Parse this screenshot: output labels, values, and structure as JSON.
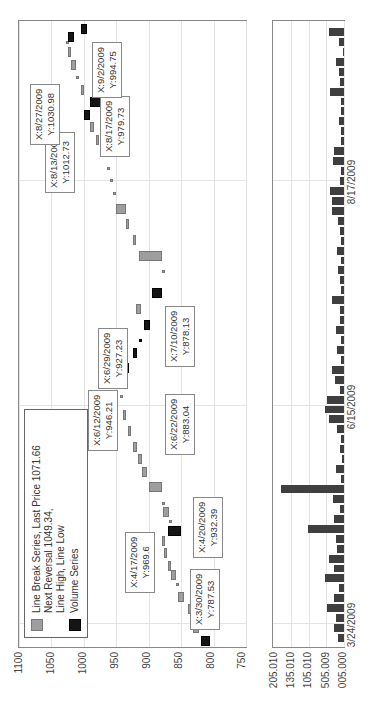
{
  "chart_data": [
    {
      "type": "bar",
      "subtype": "line-break (three-line break) price chart",
      "title": "",
      "xlabel": "",
      "ylabel": "",
      "ylim": [
        750,
        1100
      ],
      "yticks": [
        "1100",
        "1050",
        "1000",
        "950",
        "900",
        "850",
        "800",
        "750"
      ],
      "grid": true,
      "legend": {
        "position": "upper-left",
        "entries": [
          {
            "label": "Line Break Series, Last Price 1071.66 Next Reversal 1049.34, Line High, Line Low",
            "lines": [
              "Line Break Series, Last Price 1071.66",
              "Next Reversal 1049.34,",
              "Line High, Line Low"
            ],
            "color": "#9e9e9e"
          },
          {
            "label": "Volume Series",
            "lines": [
              "Volume Series"
            ],
            "color": "#151515"
          }
        ]
      },
      "annotations": [
        {
          "x": "3/30/2009",
          "y": "787.53",
          "lines": [
            "X:3/30/2009",
            "Y:787.53"
          ]
        },
        {
          "x": "4/17/2009",
          "y": "969.6",
          "lines": [
            "X:4/17/2009",
            "Y:969.6"
          ]
        },
        {
          "x": "4/20/2009",
          "y": "932.39",
          "lines": [
            "X:4/20/2009",
            "Y:932.39"
          ]
        },
        {
          "x": "6/12/2009",
          "y": "946.21",
          "lines": [
            "X:6/12/2009",
            "Y:946.21"
          ]
        },
        {
          "x": "6/22/2009",
          "y": "883.04",
          "lines": [
            "X:6/22/2009",
            "Y:883.04"
          ]
        },
        {
          "x": "6/29/2009",
          "y": "927.23",
          "lines": [
            "X:6/29/2009",
            "Y:927.23"
          ]
        },
        {
          "x": "7/10/2009",
          "y": "878.13",
          "lines": [
            "X:7/10/2009",
            "Y:878.13"
          ]
        },
        {
          "x": "8/13/2009",
          "y": "1012.73",
          "lines": [
            "X:8/13/2009",
            "Y:1012.73"
          ]
        },
        {
          "x": "8/17/2009",
          "y": "979.73",
          "lines": [
            "X:8/17/2009",
            "Y:979.73"
          ]
        },
        {
          "x": "8/27/2009",
          "y": "1030.98",
          "lines": [
            "X:8/27/2009",
            "Y:1030.98"
          ]
        },
        {
          "x": "9/2/2009",
          "y": "994.75",
          "lines": [
            "X:9/2/2009",
            "Y:994.75"
          ]
        }
      ],
      "series": [
        {
          "name": "Line Break Series",
          "note": "price bricks; up=gray, down=black; [pos(0-1 along time), open, close]",
          "bricks": [
            [
              0.01,
              820,
              805,
              "down"
            ],
            [
              0.03,
              822,
              832,
              "up"
            ],
            [
              0.045,
              810,
              790,
              "down"
            ],
            [
              0.06,
              830,
              840,
              "up"
            ],
            [
              0.08,
              845,
              855,
              "up"
            ],
            [
              0.1,
              855,
              858,
              "up"
            ],
            [
              0.115,
              858,
              866,
              "up"
            ],
            [
              0.13,
              866,
              870,
              "up"
            ],
            [
              0.15,
              872,
              877,
              "up"
            ],
            [
              0.17,
              880,
              875,
              "up"
            ],
            [
              0.185,
              870,
              850,
              "down"
            ],
            [
              0.2,
              865,
              868,
              "up"
            ],
            [
              0.215,
              868,
              878,
              "up"
            ],
            [
              0.23,
              878,
              880,
              "up"
            ],
            [
              0.255,
              880,
              900,
              "up"
            ],
            [
              0.28,
              903,
              910,
              "up"
            ],
            [
              0.3,
              910,
              917,
              "up"
            ],
            [
              0.32,
              918,
              925,
              "up"
            ],
            [
              0.345,
              928,
              932,
              "up"
            ],
            [
              0.37,
              935,
              940,
              "up"
            ],
            [
              0.4,
              942,
              945,
              "up"
            ],
            [
              0.42,
              946,
              946,
              "up"
            ],
            [
              0.445,
              940,
              930,
              "down"
            ],
            [
              0.47,
              925,
              918,
              "down"
            ],
            [
              0.49,
              915,
              912,
              "down"
            ],
            [
              0.515,
              908,
              898,
              "down"
            ],
            [
              0.54,
              912,
              920,
              "up"
            ],
            [
              0.565,
              895,
              880,
              "down"
            ],
            [
              0.6,
              878,
              880,
              "up"
            ],
            [
              0.625,
              880,
              915,
              "up"
            ],
            [
              0.65,
              920,
              925,
              "up"
            ],
            [
              0.675,
              930,
              935,
              "up"
            ],
            [
              0.7,
              935,
              950,
              "up"
            ],
            [
              0.725,
              952,
              955,
              "up"
            ],
            [
              0.745,
              958,
              960,
              "up"
            ],
            [
              0.765,
              962,
              965,
              "up"
            ],
            [
              0.79,
              965,
              975,
              "up"
            ],
            [
              0.81,
              978,
              982,
              "up"
            ],
            [
              0.83,
              985,
              990,
              "up"
            ],
            [
              0.85,
              1000,
              990,
              "down"
            ],
            [
              0.87,
              990,
              970,
              "down"
            ],
            [
              0.89,
              1000,
              1005,
              "up"
            ],
            [
              0.91,
              1010,
              1012,
              "up"
            ],
            [
              0.93,
              1012,
              1020,
              "up"
            ],
            [
              0.95,
              1020,
              1025,
              "up"
            ],
            [
              0.965,
              1025,
              1028,
              "up"
            ],
            [
              0.975,
              1025,
              1015,
              "down"
            ],
            [
              0.988,
              1005,
              995,
              "down"
            ]
          ]
        }
      ]
    },
    {
      "type": "bar",
      "title": "Volume Series",
      "xlabel": "",
      "ylabel": "",
      "yticks": [
        "205.010",
        "135.010",
        "105.010",
        "505.009",
        "005.000"
      ],
      "xticks": [
        "3/24/2009",
        "6/15/2009",
        "8/17/2009"
      ],
      "grid": true,
      "categories_note": "one bar per trading day, 3/24/2009 to ~9/10/2009",
      "values_relative": [
        0.08,
        0.15,
        0.12,
        0.25,
        0.15,
        0.07,
        0.28,
        0.14,
        0.22,
        0.1,
        0.11,
        0.52,
        0.14,
        0.06,
        0.16,
        0.92,
        0.05,
        0.12,
        0.03,
        0.06,
        0.04,
        0.1,
        0.22,
        0.28,
        0.25,
        0.06,
        0.13,
        0.17,
        0.05,
        0.1,
        0.05,
        0.12,
        0.06,
        0.06,
        0.17,
        0.04,
        0.06,
        0.08,
        0.04,
        0.1,
        0.05,
        0.06,
        0.08,
        0.18,
        0.17,
        0.2,
        0.06,
        0.05,
        0.16,
        0.14,
        0.05,
        0.05,
        0.07,
        0.05,
        0.04,
        0.2,
        0.06,
        0.07,
        0.12,
        0.02,
        0.07,
        0.22
      ]
    }
  ],
  "axis": {
    "price_ticks": [
      "1100",
      "1050",
      "1000",
      "950",
      "900",
      "850",
      "800",
      "750"
    ],
    "volume_ticks": [
      "205.010",
      "135.010",
      "105.010",
      "505.009",
      "005.000"
    ],
    "date_ticks": [
      "3/24/2009",
      "6/15/2009",
      "8/17/2009"
    ]
  },
  "legend": {
    "series1_line1": "Line Break Series, Last Price 1071.66",
    "series1_line2": "Next Reversal 1049.34,",
    "series1_line3": "Line High, Line Low",
    "series2_line1": "Volume Series"
  },
  "notes": [
    {
      "l1": "X:3/30/2009",
      "l2": "Y:787.53"
    },
    {
      "l1": "X:4/17/2009",
      "l2": "Y:969.6"
    },
    {
      "l1": "X:4/20/2009",
      "l2": "Y:932.39"
    },
    {
      "l1": "X:6/12/2009",
      "l2": "Y:946.21"
    },
    {
      "l1": "X:6/22/2009",
      "l2": "Y:883.04"
    },
    {
      "l1": "X:6/29/2009",
      "l2": "Y:927.23"
    },
    {
      "l1": "X:7/10/2009",
      "l2": "Y:878.13"
    },
    {
      "l1": "X:8/13/2009",
      "l2": "Y:1012.73"
    },
    {
      "l1": "X:8/17/2009",
      "l2": "Y:979.73"
    },
    {
      "l1": "X:8/27/2009",
      "l2": "Y:1030.98"
    },
    {
      "l1": "X:9/2/2009",
      "l2": "Y:994.75"
    }
  ]
}
